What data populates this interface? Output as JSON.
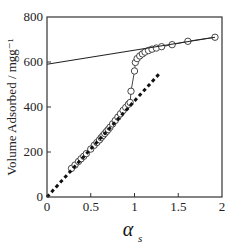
{
  "chart_data": {
    "type": "scatter",
    "title": "",
    "xlabel": "α_s",
    "xlabel_main": "α",
    "xlabel_sub": "s",
    "ylabel": "Volume Adsorbed / mgg⁻¹",
    "xlim": [
      0,
      2
    ],
    "ylim": [
      0,
      800
    ],
    "xticks": [
      0,
      0.5,
      1,
      1.5,
      2
    ],
    "xtick_labels": [
      "0",
      "0.5",
      "1",
      "1.5",
      "2"
    ],
    "yticks": [
      0,
      200,
      400,
      600,
      800
    ],
    "ytick_labels": [
      "0",
      "200",
      "400",
      "600",
      "800"
    ],
    "grid": false,
    "legend": null,
    "series": [
      {
        "name": "isotherm data",
        "style": "open-circles-connected",
        "x": [
          0.28,
          0.32,
          0.36,
          0.39,
          0.42,
          0.45,
          0.5,
          0.54,
          0.57,
          0.6,
          0.62,
          0.64,
          0.66,
          0.68,
          0.7,
          0.72,
          0.75,
          0.78,
          0.81,
          0.84,
          0.87,
          0.9,
          0.93,
          0.95,
          0.96,
          1.0,
          1.01,
          1.03,
          1.06,
          1.09,
          1.12,
          1.16,
          1.2,
          1.25,
          1.31,
          1.43,
          1.61,
          1.92
        ],
        "values": [
          127,
          142,
          158,
          170,
          181,
          193,
          213,
          230,
          242,
          254,
          264,
          273,
          282,
          291,
          300,
          310,
          325,
          340,
          355,
          370,
          385,
          398,
          412,
          420,
          470,
          560,
          598,
          615,
          627,
          636,
          644,
          651,
          657,
          662,
          668,
          677,
          692,
          710
        ]
      },
      {
        "name": "high-pressure linear fit",
        "style": "solid-line",
        "x": [
          0,
          1.92
        ],
        "values": [
          590,
          710
        ]
      },
      {
        "name": "low-pressure reference line",
        "style": "dashed-line",
        "x": [
          0,
          1.3
        ],
        "values": [
          0,
          555
        ]
      }
    ]
  }
}
